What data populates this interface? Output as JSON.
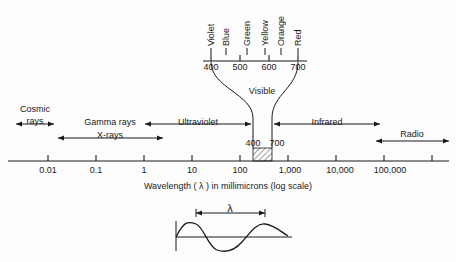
{
  "figure": {
    "axis_caption": "Wavelength  ( λ )  in millimicrons (log scale)",
    "lambda_symbol": "λ",
    "visible_label": "Visible",
    "ink_color": "#1a1a1a",
    "background_color": "#fdfdfd"
  },
  "color_scale": {
    "tick_labels": [
      "400",
      "500",
      "600",
      "700"
    ],
    "colors": [
      "Violet",
      "Blue",
      "Green",
      "Yellow",
      "Orange",
      "Red"
    ]
  },
  "visible_band": {
    "left_label": "400",
    "right_label": "700"
  },
  "bands": [
    {
      "name": "Cosmic rays",
      "label_line1": "Cosmic",
      "label_line2": "rays"
    },
    {
      "name": "Gamma rays X-rays",
      "label_line1": "Gamma rays",
      "label_line2": "X-rays"
    },
    {
      "name": "Ultraviolet",
      "label_line1": "Ultraviolet",
      "label_line2": ""
    },
    {
      "name": "Infrared",
      "label_line1": "Infrared",
      "label_line2": ""
    },
    {
      "name": "Radio",
      "label_line1": "Radio",
      "label_line2": ""
    }
  ],
  "axis": {
    "tick_labels": [
      "0.01",
      "0.1",
      "1",
      "10",
      "100",
      "1,000",
      "10,000",
      "100,000"
    ]
  }
}
